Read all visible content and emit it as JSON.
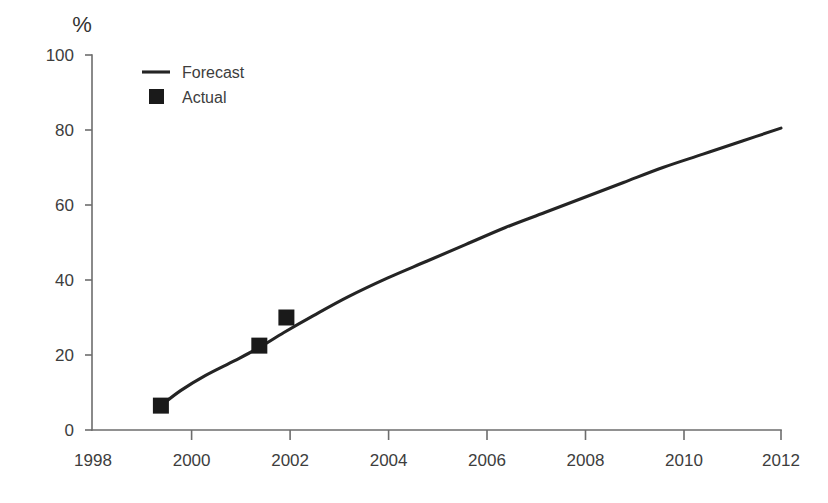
{
  "chart_data": {
    "type": "line",
    "title": "",
    "subtitle": "",
    "xlabel": "",
    "ylabel": "",
    "unit_label": "%",
    "xlim": [
      1998,
      2012
    ],
    "ylim": [
      0,
      100
    ],
    "grid": false,
    "legend_position": "top-left",
    "x_ticks": [
      1998,
      2000,
      2002,
      2004,
      2006,
      2008,
      2010,
      2012
    ],
    "x_tick_labels": [
      "1998",
      "2000",
      "2002",
      "2004",
      "2006",
      "2008",
      "2010",
      "2012"
    ],
    "y_ticks": [
      0,
      20,
      40,
      60,
      80,
      100
    ],
    "y_tick_labels": [
      "0",
      "20",
      "40",
      "60",
      "80",
      "100"
    ],
    "series": [
      {
        "name": "Forecast",
        "type": "line",
        "marker": "none",
        "color": "#242424",
        "x": [
          1999.4,
          1999.8,
          2000.3,
          2000.9,
          2001.4,
          2001.9,
          2002.5,
          2003.2,
          2004.0,
          2004.8,
          2005.6,
          2006.4,
          2007.2,
          2008.0,
          2008.8,
          2009.6,
          2010.4,
          2011.2,
          2012.0
        ],
        "values": [
          6.5,
          10.5,
          14.5,
          18.5,
          22.0,
          26.0,
          30.5,
          35.5,
          40.5,
          45.0,
          49.5,
          54.0,
          58.0,
          62.0,
          66.0,
          70.0,
          73.5,
          77.0,
          80.5
        ]
      },
      {
        "name": "Actual",
        "type": "scatter",
        "marker": "square",
        "color": "#1a1a1a",
        "x": [
          1999.4,
          2001.4,
          2001.95
        ],
        "values": [
          6.5,
          22.5,
          30.0
        ]
      }
    ],
    "legend": [
      {
        "label": "Forecast",
        "marker": "line",
        "color": "#242424"
      },
      {
        "label": "Actual",
        "marker": "square",
        "color": "#1a1a1a"
      }
    ]
  },
  "colors": {
    "background": "#ffffff",
    "axis": "#6d6d6d",
    "text": "#3d3d3d",
    "line": "#242424",
    "marker": "#1a1a1a"
  }
}
